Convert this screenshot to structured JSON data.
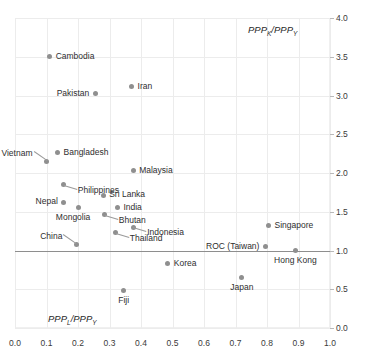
{
  "chart_data": {
    "type": "scatter",
    "title": "",
    "xlabel": "PPPL/PPPY",
    "ylabel": "PPPK/PPPY",
    "xlim": [
      0.0,
      1.0
    ],
    "ylim": [
      0.0,
      4.0
    ],
    "grid": true,
    "legend": null,
    "reference_line_y": 1.0,
    "xticks": [
      "0.0",
      "0.1",
      "0.2",
      "0.3",
      "0.4",
      "0.5",
      "0.6",
      "0.7",
      "0.8",
      "0.9",
      "1.0"
    ],
    "yticks": [
      "0.0",
      "0.5",
      "1.0",
      "1.5",
      "2.0",
      "2.5",
      "3.0",
      "3.5",
      "4.0"
    ],
    "points": [
      {
        "name": "Cambodia",
        "x": 0.11,
        "y": 3.5,
        "label_side": "right"
      },
      {
        "name": "Iran",
        "x": 0.37,
        "y": 3.11,
        "label_side": "right"
      },
      {
        "name": "Pakistan",
        "x": 0.255,
        "y": 3.02,
        "label_side": "left"
      },
      {
        "name": "Bangladesh",
        "x": 0.135,
        "y": 2.26,
        "label_side": "right"
      },
      {
        "name": "Vietnam",
        "x": 0.1,
        "y": 2.15,
        "label_side": "leader-left"
      },
      {
        "name": "Malaysia",
        "x": 0.375,
        "y": 2.03,
        "label_side": "right"
      },
      {
        "name": "Philippines",
        "x": 0.155,
        "y": 1.85,
        "label_side": "leader-right"
      },
      {
        "name": "Sri Lanka",
        "x": 0.28,
        "y": 1.71,
        "label_side": "right"
      },
      {
        "name": "Nepal",
        "x": 0.155,
        "y": 1.62,
        "label_side": "left"
      },
      {
        "name": "India",
        "x": 0.325,
        "y": 1.55,
        "label_side": "right"
      },
      {
        "name": "Mongolia",
        "x": 0.2,
        "y": 1.55,
        "label_side": "below-left"
      },
      {
        "name": "Bhutan",
        "x": 0.285,
        "y": 1.46,
        "label_side": "leader-right"
      },
      {
        "name": "Indonesia",
        "x": 0.375,
        "y": 1.3,
        "label_side": "leader-right"
      },
      {
        "name": "Singapore",
        "x": 0.805,
        "y": 1.32,
        "label_side": "right"
      },
      {
        "name": "Thailand",
        "x": 0.32,
        "y": 1.23,
        "label_side": "leader-right"
      },
      {
        "name": "China",
        "x": 0.195,
        "y": 1.08,
        "label_side": "leader-left"
      },
      {
        "name": "ROC (Taiwan)",
        "x": 0.795,
        "y": 1.05,
        "label_side": "left"
      },
      {
        "name": "Hong Kong",
        "x": 0.89,
        "y": 1.0,
        "label_side": "below"
      },
      {
        "name": "Korea",
        "x": 0.485,
        "y": 0.83,
        "label_side": "right"
      },
      {
        "name": "Japan",
        "x": 0.72,
        "y": 0.65,
        "label_side": "below"
      },
      {
        "name": "Fiji",
        "x": 0.345,
        "y": 0.48,
        "label_side": "below"
      }
    ]
  },
  "colors": {
    "marker": "#8f8f8f",
    "gridline": "#ececec",
    "axis": "#b9b9b9",
    "refline": "#8e8e8e",
    "text": "#2e2e2e"
  }
}
